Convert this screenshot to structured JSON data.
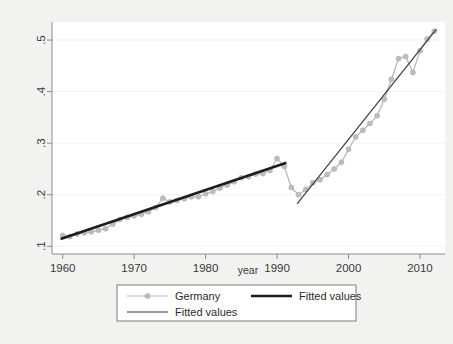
{
  "chart_data": {
    "type": "line",
    "title": "",
    "subtitle": "",
    "xlabel": "year",
    "ylabel": "",
    "xlim": [
      1958.5,
      2013.5
    ],
    "ylim": [
      0.085,
      0.535
    ],
    "grid": "horizontal-faint",
    "legend_position": "below-plot",
    "x_ticks": [
      "1960",
      "1970",
      "1980",
      "1990",
      "2000",
      "2010"
    ],
    "x_tick_values": [
      1960,
      1970,
      1980,
      1990,
      2000,
      2010
    ],
    "y_ticks": [
      ".1",
      ".2",
      ".3",
      ".4",
      ".5"
    ],
    "y_tick_values": [
      0.1,
      0.2,
      0.3,
      0.4,
      0.5
    ],
    "series": [
      {
        "name": "Germany",
        "type": "line-marker",
        "color": "#b9b9b9",
        "marker_color": "#bdbdbd",
        "x": [
          1960,
          1961,
          1962,
          1963,
          1964,
          1965,
          1966,
          1967,
          1968,
          1969,
          1970,
          1971,
          1972,
          1973,
          1974,
          1975,
          1976,
          1977,
          1978,
          1979,
          1980,
          1981,
          1982,
          1983,
          1984,
          1985,
          1986,
          1987,
          1988,
          1989,
          1990,
          1991,
          1992,
          1993,
          1994,
          1995,
          1996,
          1997,
          1998,
          1999,
          2000,
          2001,
          2002,
          2003,
          2004,
          2005,
          2006,
          2007,
          2008,
          2009,
          2010,
          2011,
          2012
        ],
        "y": [
          0.121,
          0.119,
          0.124,
          0.126,
          0.128,
          0.131,
          0.134,
          0.143,
          0.152,
          0.156,
          0.159,
          0.162,
          0.167,
          0.175,
          0.193,
          0.186,
          0.189,
          0.192,
          0.196,
          0.196,
          0.202,
          0.206,
          0.213,
          0.219,
          0.225,
          0.233,
          0.235,
          0.24,
          0.241,
          0.247,
          0.27,
          0.255,
          0.214,
          0.2,
          0.21,
          0.223,
          0.229,
          0.239,
          0.25,
          0.263,
          0.288,
          0.312,
          0.325,
          0.338,
          0.353,
          0.385,
          0.424,
          0.464,
          0.468,
          0.437,
          0.479,
          0.502,
          0.517
        ]
      },
      {
        "name": "Fitted values",
        "type": "line",
        "style": "thick-dark",
        "color": "#1c1c1c",
        "segment_x": [
          1959.7,
          1991.3
        ],
        "segment_y": [
          0.114,
          0.262
        ]
      },
      {
        "name": "Fitted values",
        "type": "line",
        "style": "thin-dark",
        "color": "#3d3d3d",
        "segment_x": [
          1992.8,
          2012.3
        ],
        "segment_y": [
          0.182,
          0.521
        ]
      }
    ],
    "annotations": []
  },
  "legend": {
    "entries": [
      {
        "label": "Germany",
        "marker": "line-with-dot",
        "color": "#b9b9b9"
      },
      {
        "label": "Fitted values",
        "marker": "thick-line",
        "color": "#1c1c1c"
      },
      {
        "label": "Fitted values",
        "marker": "thin-line",
        "color": "#3d3d3d"
      }
    ]
  },
  "colors": {
    "background": "#f2f2f1",
    "plot_background": "#ffffff",
    "axis": "#8c8c8c",
    "gridline": "#f3f3f6",
    "text": "#3a3a3a",
    "legend_border": "#7d7d7d"
  }
}
